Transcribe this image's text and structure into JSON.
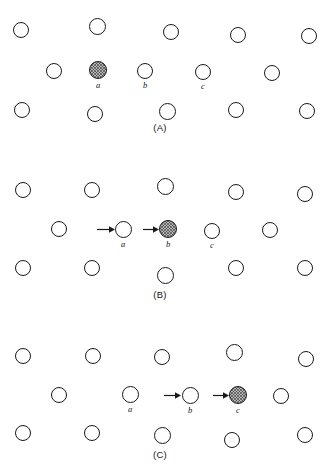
{
  "figure": {
    "type": "lattice-diffusion-diagram",
    "background_color": "#ffffff",
    "outline_color": "#1a1a1a",
    "shaded_fill_color": "#b9b9b9",
    "atom_radius_px": 8,
    "panel_count": 3
  },
  "panels": [
    {
      "id": "A",
      "label": "(A)",
      "label_x": 160,
      "label_y": 123,
      "rows": [
        {
          "name": "top-row",
          "atoms": [
            {
              "cx": 21,
              "cy": 30,
              "r": 8,
              "shaded": false,
              "label": ""
            },
            {
              "cx": 97,
              "cy": 26,
              "r": 8.5,
              "shaded": false,
              "label": ""
            },
            {
              "cx": 171,
              "cy": 32,
              "r": 8,
              "shaded": false,
              "label": ""
            },
            {
              "cx": 238,
              "cy": 35,
              "r": 8,
              "shaded": false,
              "label": ""
            },
            {
              "cx": 309,
              "cy": 36,
              "r": 8,
              "shaded": false,
              "label": ""
            }
          ]
        },
        {
          "name": "middle-row",
          "atoms": [
            {
              "cx": 54,
              "cy": 71,
              "r": 8,
              "shaded": false,
              "label": ""
            },
            {
              "cx": 98,
              "cy": 70,
              "r": 9,
              "shaded": true,
              "label": "a"
            },
            {
              "cx": 145,
              "cy": 71,
              "r": 8,
              "shaded": false,
              "label": "b"
            },
            {
              "cx": 203,
              "cy": 72,
              "r": 8,
              "shaded": false,
              "label": "c"
            },
            {
              "cx": 272,
              "cy": 73,
              "r": 8,
              "shaded": false,
              "label": ""
            }
          ]
        },
        {
          "name": "bottom-row",
          "atoms": [
            {
              "cx": 22,
              "cy": 110,
              "r": 8,
              "shaded": false,
              "label": ""
            },
            {
              "cx": 95,
              "cy": 114,
              "r": 8,
              "shaded": false,
              "label": ""
            },
            {
              "cx": 167,
              "cy": 111,
              "r": 8.5,
              "shaded": false,
              "label": ""
            },
            {
              "cx": 236,
              "cy": 110,
              "r": 8,
              "shaded": false,
              "label": ""
            },
            {
              "cx": 307,
              "cy": 111,
              "r": 8,
              "shaded": false,
              "label": ""
            }
          ]
        }
      ],
      "arrows": []
    },
    {
      "id": "B",
      "label": "(B)",
      "label_x": 160,
      "label_y": 290,
      "rows": [
        {
          "name": "top-row",
          "atoms": [
            {
              "cx": 23,
              "cy": 190,
              "r": 8,
              "shaded": false,
              "label": ""
            },
            {
              "cx": 92,
              "cy": 190,
              "r": 8,
              "shaded": false,
              "label": ""
            },
            {
              "cx": 165,
              "cy": 186,
              "r": 8.5,
              "shaded": false,
              "label": ""
            },
            {
              "cx": 236,
              "cy": 192,
              "r": 8,
              "shaded": false,
              "label": ""
            },
            {
              "cx": 305,
              "cy": 194,
              "r": 8,
              "shaded": false,
              "label": ""
            }
          ]
        },
        {
          "name": "middle-row",
          "atoms": [
            {
              "cx": 59,
              "cy": 229,
              "r": 8,
              "shaded": false,
              "label": ""
            },
            {
              "cx": 123,
              "cy": 229,
              "r": 8.5,
              "shaded": false,
              "label": "a"
            },
            {
              "cx": 168,
              "cy": 229,
              "r": 9,
              "shaded": true,
              "label": "b"
            },
            {
              "cx": 212,
              "cy": 231,
              "r": 8,
              "shaded": false,
              "label": "c"
            },
            {
              "cx": 270,
              "cy": 230,
              "r": 8,
              "shaded": false,
              "label": ""
            }
          ]
        },
        {
          "name": "bottom-row",
          "atoms": [
            {
              "cx": 23,
              "cy": 268,
              "r": 8,
              "shaded": false,
              "label": ""
            },
            {
              "cx": 92,
              "cy": 268,
              "r": 8,
              "shaded": false,
              "label": ""
            },
            {
              "cx": 165,
              "cy": 275,
              "r": 8.5,
              "shaded": false,
              "label": ""
            },
            {
              "cx": 236,
              "cy": 268,
              "r": 8,
              "shaded": false,
              "label": ""
            },
            {
              "cx": 305,
              "cy": 268,
              "r": 8,
              "shaded": false,
              "label": ""
            }
          ]
        }
      ],
      "arrows": [
        {
          "name": "arrow-to-a",
          "x": 97,
          "y": 226,
          "length": 18,
          "target": "a"
        },
        {
          "name": "arrow-to-b",
          "x": 143,
          "y": 226,
          "length": 16,
          "target": "b"
        }
      ]
    },
    {
      "id": "C",
      "label": "(C)",
      "label_x": 160,
      "label_y": 450,
      "rows": [
        {
          "name": "top-row",
          "atoms": [
            {
              "cx": 23,
              "cy": 356,
              "r": 8,
              "shaded": false,
              "label": ""
            },
            {
              "cx": 93,
              "cy": 356,
              "r": 8,
              "shaded": false,
              "label": ""
            },
            {
              "cx": 162,
              "cy": 357,
              "r": 8,
              "shaded": false,
              "label": ""
            },
            {
              "cx": 234,
              "cy": 352,
              "r": 8.5,
              "shaded": false,
              "label": ""
            },
            {
              "cx": 306,
              "cy": 359,
              "r": 8,
              "shaded": false,
              "label": ""
            }
          ]
        },
        {
          "name": "middle-row",
          "atoms": [
            {
              "cx": 59,
              "cy": 395,
              "r": 8,
              "shaded": false,
              "label": ""
            },
            {
              "cx": 130,
              "cy": 394,
              "r": 8.5,
              "shaded": false,
              "label": "a"
            },
            {
              "cx": 190,
              "cy": 395,
              "r": 8.5,
              "shaded": false,
              "label": "b"
            },
            {
              "cx": 238,
              "cy": 395,
              "r": 9,
              "shaded": true,
              "label": "c"
            },
            {
              "cx": 281,
              "cy": 396,
              "r": 8,
              "shaded": false,
              "label": ""
            }
          ]
        },
        {
          "name": "bottom-row",
          "atoms": [
            {
              "cx": 23,
              "cy": 433,
              "r": 8,
              "shaded": false,
              "label": ""
            },
            {
              "cx": 92,
              "cy": 433,
              "r": 8,
              "shaded": false,
              "label": ""
            },
            {
              "cx": 162,
              "cy": 435,
              "r": 8.5,
              "shaded": false,
              "label": ""
            },
            {
              "cx": 232,
              "cy": 440,
              "r": 8,
              "shaded": false,
              "label": ""
            },
            {
              "cx": 305,
              "cy": 435,
              "r": 8,
              "shaded": false,
              "label": ""
            }
          ]
        }
      ],
      "arrows": [
        {
          "name": "arrow-to-b",
          "x": 164,
          "y": 392,
          "length": 17,
          "target": "b"
        },
        {
          "name": "arrow-to-c",
          "x": 213,
          "y": 392,
          "length": 16,
          "target": "c"
        }
      ]
    }
  ]
}
